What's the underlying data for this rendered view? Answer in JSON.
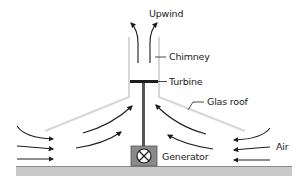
{
  "labels": {
    "upwind": "Upwind",
    "chimney": "Chimney",
    "turbine": "Turbine",
    "glass_roof": "Glas roof",
    "air": "Air",
    "generator": "Generator"
  },
  "colors": {
    "ground": "#c9c9c9",
    "glass": "#d7d7d7",
    "chimney_wall": "#d0d0d0",
    "arrow": "#1e1e1e",
    "generator_fill": "#8a8a8a",
    "turbine": "#1e1e1e",
    "shaft": "#555555"
  }
}
